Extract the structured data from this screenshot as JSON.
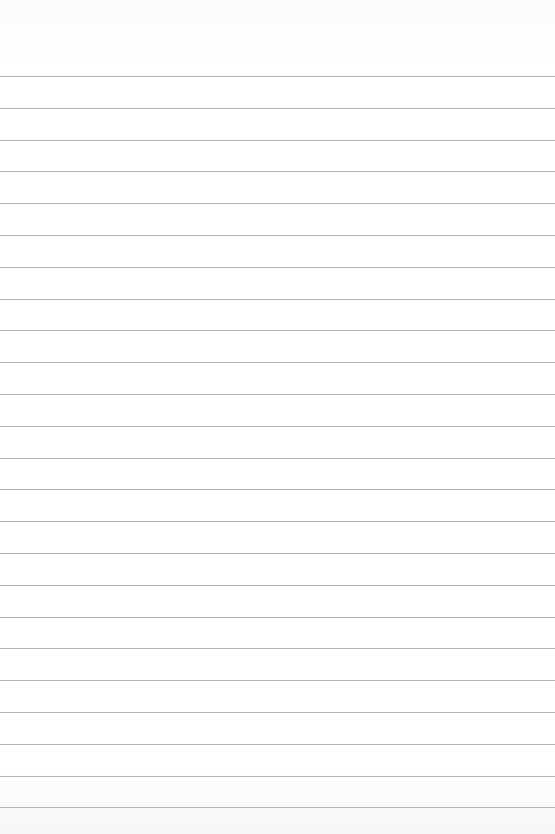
{
  "document": {
    "type": "lined-paper",
    "line_count": 24,
    "first_line_y": 76,
    "line_spacing": 31.8,
    "line_color": "#a8a8a8",
    "background_color": "#ffffff",
    "text_content": []
  }
}
